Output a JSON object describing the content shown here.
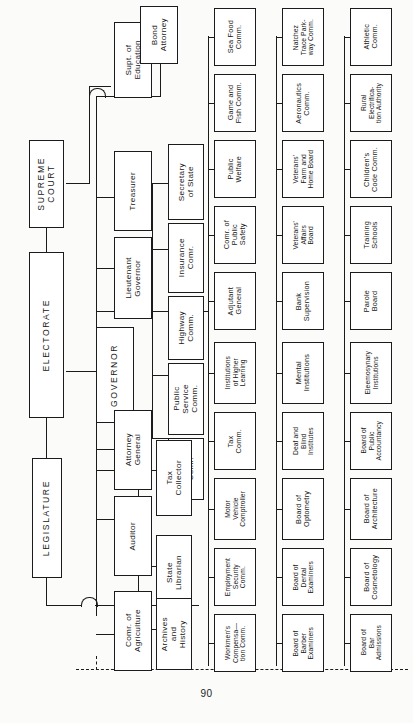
{
  "document": {
    "title": "State Government Organization Chart",
    "page_number": "90",
    "orientation": "rotated-90-ccw"
  },
  "nodes": {
    "supreme_court": "SUPREME\nCOURT",
    "electorate": "ELECTORATE",
    "legislature": "LEGISLATURE",
    "governor": "GOVERNOR",
    "supt_education": "Supt. of\nEducation",
    "bond_attorney": "Bond\nAttorney",
    "treasurer": "Treasurer",
    "lieutenant_governor": "Lieutenant\nGovernor",
    "attorney_general": "Attorney\nGeneral",
    "auditor": "Auditor",
    "comr_agriculture": "Comr. of\nAgriculture",
    "secretary_of_state": "Secretary\nof State",
    "insurance_comr": "Insurance\nComr.",
    "highway_comm": "Highway\nComm.",
    "public_service_comm": "Public\nService\nComm.",
    "land_comr": "Land\nComr.",
    "tax_collector": "Tax\nCollector",
    "state_librarian": "State\nLibrarian",
    "archives_and_history": "Archives\nand\nHistory"
  },
  "branches": [
    {
      "id": "row-a",
      "items": [
        "Sea Food\nComm.",
        "Game and\nFish Comm.",
        "Public\nWelfare",
        "Comr. of\nPublic\nSafety",
        "Adjutant\nGeneral",
        "Institutions\nof Higher\nLearning",
        "Tax\nComm.",
        "Motor\nVehicle\nComptroller",
        "Employment\nSecurity\nComm.",
        "Workmen's\nCompensa—\ntion Comm."
      ]
    },
    {
      "id": "row-b",
      "items": [
        "Natchez\nTrace Park-\nway Comm.",
        "Aeronautics\nComm.",
        "Veterans'\nFarm and\nHome Board",
        "Veterans'\nAffairs\nBoard",
        "Bank\nSupervision",
        "Mental\nInstitutions",
        "Deaf and\nBlind\nInstitutes",
        "Board of\nOptometry",
        "Board of\nDental\nExaminers",
        "Board of\nBarber\nExaminers"
      ]
    },
    {
      "id": "row-c",
      "items": [
        "Athletic\nComm.",
        "Rural\nElectrifica-\ntion Authority",
        "Children's\nCode Comm.",
        "Training\nSchools",
        "Parole\nBoard",
        "Eleemosynary\nInstitutions",
        "Board of\nPublic\nAccountancy",
        "Board of\nArchitecture",
        "Board of\nCosmetology",
        "Board of\nBar\nAdmissions"
      ]
    }
  ],
  "colors": {
    "ink": "#1b1b1b",
    "paper": "#fbfbf9",
    "box_fill": "#ffffff"
  }
}
